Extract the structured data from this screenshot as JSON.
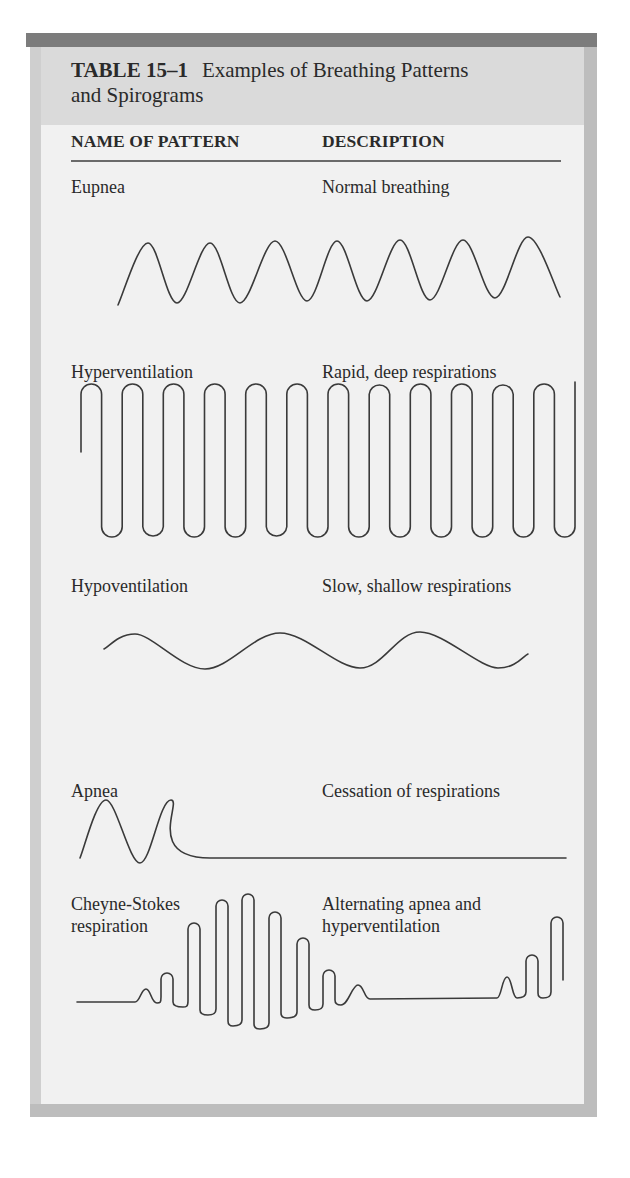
{
  "table": {
    "number": "TABLE 15–1",
    "title_line1": "Examples of Breathing Patterns",
    "title_line2": "and Spirograms",
    "columns": [
      "NAME OF PATTERN",
      "DESCRIPTION"
    ]
  },
  "colors": {
    "top_bar": "#7c7c7c",
    "header_band": "#dadada",
    "body": "#f1f1f1",
    "border": "#bdbdbd",
    "ink": "#2a2a2a"
  },
  "rows": [
    {
      "name": "Eupnea",
      "description": [
        "Normal breathing"
      ],
      "wave": {
        "type": "smooth",
        "points": [
          [
            118,
            305
          ],
          [
            148,
            243
          ],
          [
            177,
            303
          ],
          [
            210,
            243
          ],
          [
            240,
            303
          ],
          [
            275,
            241
          ],
          [
            307,
            301
          ],
          [
            337,
            241
          ],
          [
            367,
            301
          ],
          [
            400,
            240
          ],
          [
            430,
            300
          ],
          [
            463,
            240
          ],
          [
            495,
            298
          ],
          [
            528,
            237
          ],
          [
            560,
            297
          ]
        ]
      }
    },
    {
      "name": "Hyperventilation",
      "description": [
        "Rapid, deep respirations"
      ],
      "wave": {
        "type": "square-loops",
        "start": [
          81,
          452
        ],
        "top": 384,
        "bottom": 537,
        "x_start": 81,
        "x_end": 575,
        "cycles": 12,
        "end_y": 382
      }
    },
    {
      "name": "Hypoventilation",
      "description": [
        "Slow, shallow respirations"
      ],
      "wave": {
        "type": "smooth",
        "points": [
          [
            104,
            649
          ],
          [
            135,
            634
          ],
          [
            205,
            669
          ],
          [
            280,
            633
          ],
          [
            360,
            668
          ],
          [
            420,
            632
          ],
          [
            498,
            668
          ],
          [
            528,
            654
          ]
        ]
      }
    },
    {
      "name": "Apnea",
      "description": [
        "Cessation of respirations"
      ],
      "wave": {
        "type": "smooth",
        "points": [
          [
            80,
            858
          ],
          [
            106,
            800
          ],
          [
            140,
            863
          ],
          [
            171,
            800
          ],
          [
            210,
            858
          ],
          [
            566,
            858
          ]
        ]
      }
    },
    {
      "name": [
        "Cheyne-Stokes",
        "respiration"
      ],
      "description": [
        "Alternating apnea and",
        "hyperventilation"
      ],
      "wave": {
        "type": "mixed",
        "flat_start": [
          [
            77,
            1002
          ],
          [
            135,
            1002
          ]
        ],
        "segments": [
          {
            "peak": [
              146,
              989
            ],
            "valley": [
              157,
              1003
            ],
            "w": 10
          },
          {
            "peak": [
              167,
              973
            ],
            "valley": [
              183,
              1007
            ],
            "w": 12
          },
          {
            "peak": [
              194,
              923
            ],
            "valley": [
              208,
              1015
            ],
            "w": 12
          },
          {
            "peak": [
              222,
              900
            ],
            "valley": [
              233,
              1026
            ],
            "w": 12
          },
          {
            "peak": [
              248,
              894
            ],
            "valley": [
              260,
              1029
            ],
            "w": 12
          },
          {
            "peak": [
              275,
              912
            ],
            "valley": [
              287,
              1018
            ],
            "w": 12
          },
          {
            "peak": [
              303,
              938
            ],
            "valley": [
              315,
              1010
            ],
            "w": 12
          },
          {
            "peak": [
              329,
              970
            ],
            "valley": [
              341,
              1005
            ],
            "w": 12
          },
          {
            "peak": [
              358,
              985
            ],
            "valley": [
              370,
              999
            ],
            "w": 12
          }
        ],
        "flat_mid": [
          [
            370,
            999
          ],
          [
            497,
            998
          ]
        ],
        "tail": [
          {
            "peak": [
              507,
              977
            ],
            "valley": [
              517,
              998
            ],
            "w": 10
          },
          {
            "peak": [
              532,
              955
            ],
            "valley": [
              543,
              998
            ],
            "w": 12
          }
        ],
        "end": {
          "peak": [
            557,
            917
          ],
          "drop_to": [
            562,
            980
          ],
          "w": 12
        }
      }
    }
  ],
  "layout": {
    "row_label_tops": [
      179,
      364,
      577,
      782
    ],
    "cheyne_label_top": 893
  }
}
